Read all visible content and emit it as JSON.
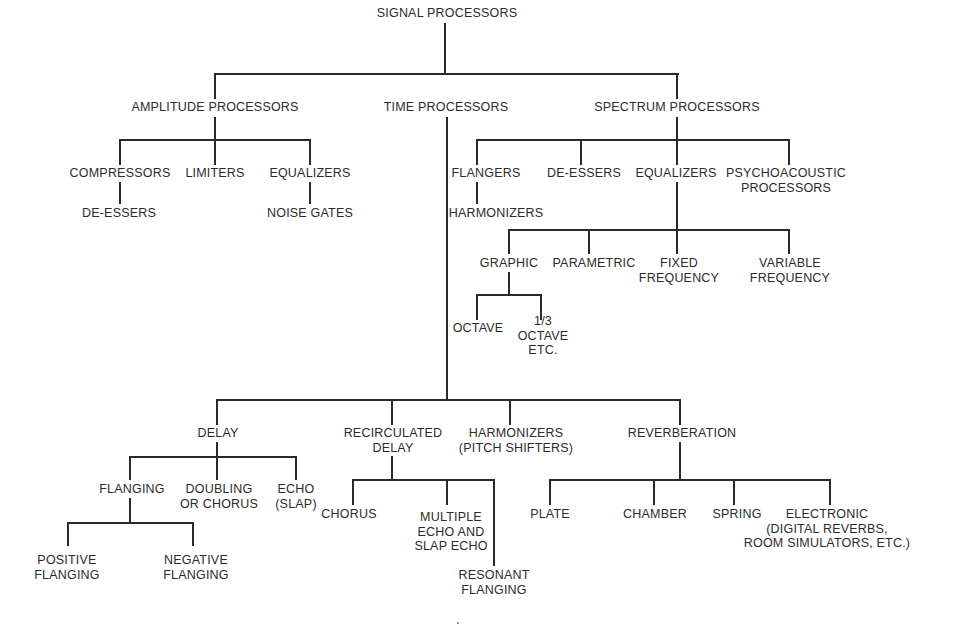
{
  "diagram": {
    "type": "tree",
    "root": "SIGNAL PROCESSORS",
    "nodes": {
      "root": "SIGNAL PROCESSORS",
      "amplitude": "AMPLITUDE PROCESSORS",
      "time": "TIME PROCESSORS",
      "spectrum": "SPECTRUM PROCESSORS",
      "compressors": "COMPRESSORS",
      "limiters": "LIMITERS",
      "amp_equalizers": "EQUALIZERS",
      "amp_deessers": "DE-ESSERS",
      "noise_gates": "NOISE GATES",
      "flangers": "FLANGERS",
      "spec_deessers": "DE-ESSERS",
      "spec_equalizers": "EQUALIZERS",
      "psycho_l1": "PSYCHOACOUSTIC",
      "psycho_l2": "PROCESSORS",
      "spec_harmonizers": "HARMONIZERS",
      "graphic": "GRAPHIC",
      "parametric": "PARAMETRIC",
      "fixed_l1": "FIXED",
      "fixed_l2": "FREQUENCY",
      "variable_l1": "VARIABLE",
      "variable_l2": "FREQUENCY",
      "octave": "OCTAVE",
      "third_l1": "1/3",
      "third_l2": "OCTAVE",
      "third_l3": "ETC.",
      "delay": "DELAY",
      "recirc_l1": "RECIRCULATED",
      "recirc_l2": "DELAY",
      "harm_l1": "HARMONIZERS",
      "harm_l2": "(PITCH SHIFTERS)",
      "reverb": "REVERBERATION",
      "flanging": "FLANGING",
      "doubling_l1": "DOUBLING",
      "doubling_l2": "OR CHORUS",
      "echo_l1": "ECHO",
      "echo_l2": "(SLAP)",
      "positive_l1": "POSITIVE",
      "positive_l2": "FLANGING",
      "negative_l1": "NEGATIVE",
      "negative_l2": "FLANGING",
      "chorus": "CHORUS",
      "multi_l1": "MULTIPLE",
      "multi_l2": "ECHO AND",
      "multi_l3": "SLAP ECHO",
      "resonant_l1": "RESONANT",
      "resonant_l2": "FLANGING",
      "plate": "PLATE",
      "chamber": "CHAMBER",
      "spring": "SPRING",
      "electronic_l1": "ELECTRONIC",
      "electronic_l2": "(DIGITAL REVERBS,",
      "electronic_l3": "ROOM SIMULATORS, ETC.)"
    },
    "edges": [
      [
        "SIGNAL PROCESSORS",
        "AMPLITUDE PROCESSORS"
      ],
      [
        "SIGNAL PROCESSORS",
        "TIME PROCESSORS"
      ],
      [
        "SIGNAL PROCESSORS",
        "SPECTRUM PROCESSORS"
      ],
      [
        "AMPLITUDE PROCESSORS",
        "COMPRESSORS"
      ],
      [
        "AMPLITUDE PROCESSORS",
        "LIMITERS"
      ],
      [
        "AMPLITUDE PROCESSORS",
        "EQUALIZERS"
      ],
      [
        "COMPRESSORS",
        "DE-ESSERS"
      ],
      [
        "EQUALIZERS",
        "NOISE GATES"
      ],
      [
        "SPECTRUM PROCESSORS",
        "FLANGERS"
      ],
      [
        "SPECTRUM PROCESSORS",
        "DE-ESSERS"
      ],
      [
        "SPECTRUM PROCESSORS",
        "EQUALIZERS"
      ],
      [
        "SPECTRUM PROCESSORS",
        "PSYCHOACOUSTIC PROCESSORS"
      ],
      [
        "FLANGERS",
        "HARMONIZERS"
      ],
      [
        "EQUALIZERS",
        "GRAPHIC"
      ],
      [
        "EQUALIZERS",
        "PARAMETRIC"
      ],
      [
        "EQUALIZERS",
        "FIXED FREQUENCY"
      ],
      [
        "EQUALIZERS",
        "VARIABLE FREQUENCY"
      ],
      [
        "GRAPHIC",
        "OCTAVE"
      ],
      [
        "GRAPHIC",
        "1/3 OCTAVE ETC."
      ],
      [
        "TIME PROCESSORS",
        "DELAY"
      ],
      [
        "TIME PROCESSORS",
        "RECIRCULATED DELAY"
      ],
      [
        "TIME PROCESSORS",
        "HARMONIZERS (PITCH SHIFTERS)"
      ],
      [
        "TIME PROCESSORS",
        "REVERBERATION"
      ],
      [
        "DELAY",
        "FLANGING"
      ],
      [
        "DELAY",
        "DOUBLING OR CHORUS"
      ],
      [
        "DELAY",
        "ECHO (SLAP)"
      ],
      [
        "FLANGING",
        "POSITIVE FLANGING"
      ],
      [
        "FLANGING",
        "NEGATIVE FLANGING"
      ],
      [
        "RECIRCULATED DELAY",
        "CHORUS"
      ],
      [
        "RECIRCULATED DELAY",
        "MULTIPLE ECHO AND SLAP ECHO"
      ],
      [
        "RECIRCULATED DELAY",
        "RESONANT FLANGING"
      ],
      [
        "REVERBERATION",
        "PLATE"
      ],
      [
        "REVERBERATION",
        "CHAMBER"
      ],
      [
        "REVERBERATION",
        "SPRING"
      ],
      [
        "REVERBERATION",
        "ELECTRONIC (DIGITAL REVERBS, ROOM SIMULATORS, ETC.)"
      ]
    ]
  },
  "style": {
    "line_color": "#2a2a2a",
    "text_color": "#2b2b2b",
    "background": "#ffffff"
  }
}
